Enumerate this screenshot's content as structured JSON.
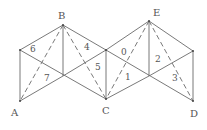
{
  "diagram": {
    "vertices": {
      "A": {
        "label": "A",
        "x": 20,
        "y": 101
      },
      "B": {
        "label": "B",
        "x": 63,
        "y": 25
      },
      "C": {
        "label": "C",
        "x": 106,
        "y": 99
      },
      "D": {
        "label": "D",
        "x": 193,
        "y": 101
      },
      "E": {
        "label": "E",
        "x": 149,
        "y": 21
      }
    },
    "face_labels": [
      "0",
      "1",
      "2",
      "3",
      "4",
      "5",
      "6",
      "7"
    ],
    "colors": {
      "line": "#6a6a6a",
      "text": "#555555",
      "background": "#ffffff"
    }
  }
}
